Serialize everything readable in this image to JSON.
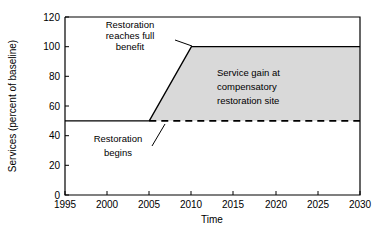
{
  "chart_data": {
    "type": "line",
    "title": "",
    "subtitle": "",
    "xlabel": "Time",
    "ylabel": "Services (percent of baseline)",
    "xlim": [
      1995,
      2030
    ],
    "ylim": [
      0,
      120
    ],
    "grid": false,
    "legend": "none",
    "x_ticks": [
      "1995",
      "2000",
      "2005",
      "2010",
      "2015",
      "2020",
      "2025",
      "2030"
    ],
    "x_tick_values": [
      1995,
      2000,
      2005,
      2010,
      2015,
      2020,
      2025,
      2030
    ],
    "y_ticks": [
      "0",
      "20",
      "40",
      "60",
      "80",
      "100",
      "120"
    ],
    "y_tick_values": [
      0,
      20,
      40,
      60,
      80,
      100,
      120
    ],
    "series": [
      {
        "name": "Restoration services",
        "style": "solid",
        "x": [
          1995,
          2005,
          2010,
          2030
        ],
        "values": [
          50,
          50,
          100,
          100
        ]
      },
      {
        "name": "Baseline (without restoration)",
        "style": "dashed",
        "x": [
          2005,
          2030
        ],
        "values": [
          50,
          50
        ]
      }
    ],
    "shaded_region": {
      "name": "Service gain at compensatory restoration site",
      "fill": "#d9d9d9",
      "x": [
        2005,
        2010,
        2030,
        2030,
        2005
      ],
      "y": [
        50,
        100,
        100,
        50,
        50
      ]
    },
    "annotations": [
      {
        "id": "restoration-full-benefit",
        "text_lines": [
          "Restoration",
          "reaches full",
          "benefit"
        ],
        "align": "center",
        "text_x": 130,
        "text_y": 28,
        "leader": {
          "x1": 175,
          "y1": 46,
          "x2": 190,
          "y2": 46
        }
      },
      {
        "id": "restoration-begins",
        "text_lines": [
          "Restoration",
          "begins"
        ],
        "align": "center",
        "text_x": 118,
        "text_y": 139,
        "leader": {
          "x1": 153,
          "y1": 147,
          "x2": 168,
          "y2": 124
        }
      },
      {
        "id": "service-gain",
        "text_lines": [
          "Service gain at",
          "compensatory",
          "restoration site"
        ],
        "align": "left",
        "text_x": 217,
        "text_y": 73,
        "leader": null
      }
    ],
    "colors": {
      "axis": "#000000",
      "line": "#000000",
      "shade_fill": "#d9d9d9",
      "background": "#ffffff"
    }
  },
  "plot_geometry": {
    "left": 65,
    "right": 360,
    "top": 17,
    "bottom": 195
  }
}
